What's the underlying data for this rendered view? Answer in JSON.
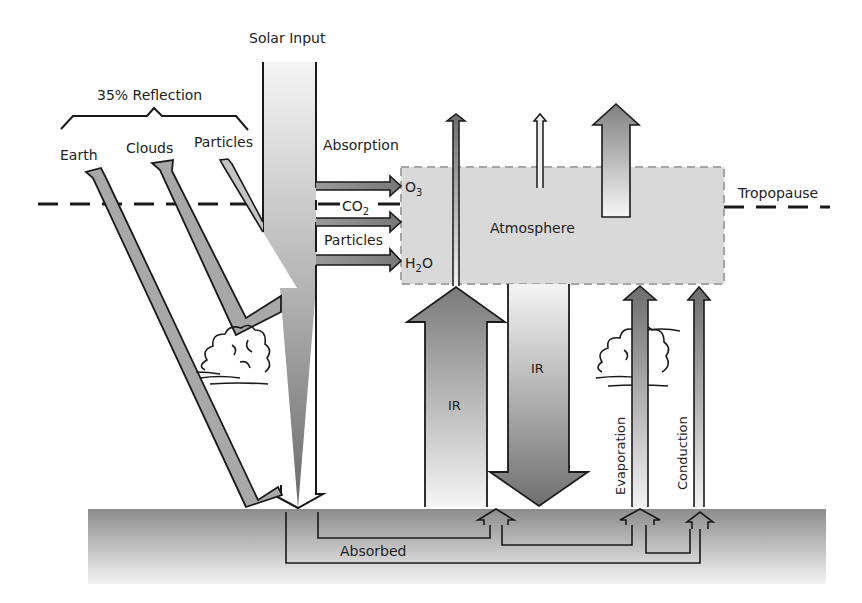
{
  "diagram": {
    "title": "Solar Input",
    "reflection": {
      "label": "35% Reflection",
      "items": [
        "Earth",
        "Clouds",
        "Particles"
      ]
    },
    "absorption": {
      "label": "Absorption",
      "absorbers": [
        "O",
        "CO",
        "Particles",
        "H",
        "O"
      ],
      "o3": {
        "base": "O",
        "sub": "3"
      },
      "co2": {
        "base": "CO",
        "sub": "2"
      },
      "particles": "Particles",
      "h2o": {
        "base": "H",
        "sub": "2",
        "tail": "O"
      }
    },
    "atmosphere_label": "Atmosphere",
    "tropopause_label": "Tropopause",
    "ir_up_label": "IR",
    "ir_down_label": "IR",
    "evaporation_label": "Evaporation",
    "conduction_label": "Conduction",
    "absorbed_label": "Absorbed",
    "colors": {
      "arrow_dark": "#6e6e6e",
      "arrow_mid": "#9a9a9a",
      "arrow_light": "#f0f0f0",
      "atmosphere_fill": "#d9d9d9",
      "ground_top": "#8f8f8f",
      "ground_bottom": "#f5f5f5",
      "outline": "#1a1a1a"
    }
  }
}
